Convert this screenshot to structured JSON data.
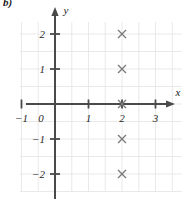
{
  "panel": {
    "label": "b)"
  },
  "axes": {
    "x_label": "x",
    "y_label": "y",
    "x_ticks": [
      {
        "value": -1,
        "label": "-1"
      },
      {
        "value": 0,
        "label": "0"
      },
      {
        "value": 1,
        "label": "1"
      },
      {
        "value": 2,
        "label": "2"
      },
      {
        "value": 3,
        "label": "3"
      }
    ],
    "y_ticks": [
      {
        "value": 2,
        "label": "2"
      },
      {
        "value": 1,
        "label": "1"
      },
      {
        "value": -1,
        "label": "-1"
      },
      {
        "value": -2,
        "label": "-2"
      }
    ],
    "origin_label": "0"
  },
  "colors": {
    "axis": "#4a4a4a",
    "grid": "#e6e6e6",
    "marker": "#7a7a7a",
    "text": "#1f1f1f",
    "background": "#ffffff"
  },
  "chart_data": {
    "type": "scatter",
    "title": "",
    "xlabel": "x",
    "ylabel": "y",
    "xlim": [
      -1.5,
      3.5
    ],
    "ylim": [
      -2.5,
      2.5
    ],
    "grid": true,
    "grid_step": 0.5,
    "legend": "none",
    "marker_style": "x",
    "series": [
      {
        "name": "points",
        "points": [
          {
            "x": 2,
            "y": 2
          },
          {
            "x": 2,
            "y": 1
          },
          {
            "x": 2,
            "y": 0
          },
          {
            "x": 2,
            "y": -1
          },
          {
            "x": 2,
            "y": -2
          }
        ]
      }
    ]
  }
}
